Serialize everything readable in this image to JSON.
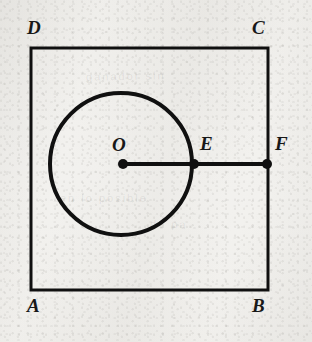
{
  "figure": {
    "background_color": "#f2f1ee",
    "ink_color": "#101010",
    "canvas": {
      "width": 312,
      "height": 342
    },
    "square": {
      "name": "ABCD",
      "left": 31,
      "top": 48,
      "right": 268,
      "bottom": 290,
      "width": 237,
      "height": 242,
      "stroke_width": 3,
      "stroke_color": "#101010"
    },
    "circle": {
      "center_x": 121,
      "center_y": 164,
      "radius": 71,
      "stroke_width": 4,
      "stroke_color": "#101010",
      "fill": "none"
    },
    "segment": {
      "from": "O",
      "through": "E",
      "to": "F",
      "x1": 123,
      "x2": 267,
      "y": 164,
      "stroke_width": 4,
      "stroke_color": "#101010"
    },
    "points": [
      {
        "id": "O",
        "label": "O",
        "x": 123,
        "y": 164,
        "dot_radius": 5,
        "label_x": 112,
        "label_y": 135,
        "role": "circle-center"
      },
      {
        "id": "E",
        "label": "E",
        "x": 194,
        "y": 164,
        "dot_radius": 5,
        "label_x": 200,
        "label_y": 134,
        "role": "circle-point"
      },
      {
        "id": "F",
        "label": "F",
        "x": 267,
        "y": 164,
        "dot_radius": 5,
        "label_x": 275,
        "label_y": 134,
        "role": "square-edge-point"
      }
    ],
    "vertices": [
      {
        "id": "A",
        "label": "A",
        "x": 31,
        "y": 290,
        "label_x": 27,
        "label_y": 296,
        "corner": "bottom-left"
      },
      {
        "id": "B",
        "label": "B",
        "x": 268,
        "y": 290,
        "label_x": 252,
        "label_y": 296,
        "corner": "bottom-right"
      },
      {
        "id": "C",
        "label": "C",
        "x": 268,
        "y": 48,
        "label_x": 252,
        "label_y": 18,
        "corner": "top-right"
      },
      {
        "id": "D",
        "label": "D",
        "x": 31,
        "y": 48,
        "label_x": 27,
        "label_y": 18,
        "corner": "top-left"
      }
    ],
    "bleed_text": [
      {
        "text": "ganador sin",
        "x": 86,
        "y": 70,
        "rotate": -1
      },
      {
        "text": "en lo posible",
        "x": 60,
        "y": 192,
        "rotate": 0
      },
      {
        "text": "de pa",
        "x": 150,
        "y": 218,
        "rotate": 1
      }
    ]
  }
}
